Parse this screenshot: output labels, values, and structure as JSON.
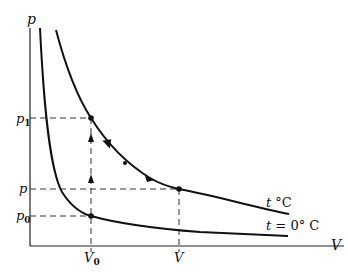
{
  "diagram": {
    "axes": {
      "y_label": "p",
      "x_label": "V"
    },
    "y_ticks": {
      "p1": {
        "base": "p",
        "sub": "1"
      },
      "p": {
        "base": "p",
        "sub": ""
      },
      "p0": {
        "base": "p",
        "sub": "0"
      }
    },
    "x_ticks": {
      "V0": {
        "base": "V",
        "sub": "0"
      },
      "V": {
        "base": "V",
        "sub": ""
      }
    },
    "curves": {
      "hot": {
        "var": "t",
        "unit": " °C",
        "label": "t °C"
      },
      "cold": {
        "var": "t",
        "unit": " = 0° C",
        "label": "t = 0° C"
      }
    },
    "colors": {
      "line": "#111111",
      "background": "#ffffff"
    }
  }
}
